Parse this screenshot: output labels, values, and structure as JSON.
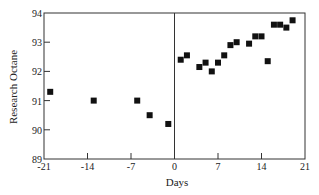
{
  "chart_data": {
    "type": "scatter",
    "title": "",
    "xlabel": "Days",
    "ylabel": "Research Octane",
    "xlim": [
      -21,
      21
    ],
    "ylim": [
      89,
      94
    ],
    "x_ticks": [
      -21,
      -14,
      -7,
      0,
      7,
      14,
      21
    ],
    "y_ticks": [
      89,
      90,
      91,
      92,
      93,
      94
    ],
    "grid": false,
    "legend": null,
    "reference_line": {
      "axis": "x",
      "value": 0
    },
    "marker": "square",
    "marker_color": "#111111",
    "series": [
      {
        "name": "Research Octane",
        "points": [
          {
            "x": -20,
            "y": 91.3
          },
          {
            "x": -13,
            "y": 91.0
          },
          {
            "x": -6,
            "y": 91.0
          },
          {
            "x": -4,
            "y": 90.5
          },
          {
            "x": -1,
            "y": 90.2
          },
          {
            "x": 1,
            "y": 92.4
          },
          {
            "x": 2,
            "y": 92.55
          },
          {
            "x": 4,
            "y": 92.15
          },
          {
            "x": 5,
            "y": 92.3
          },
          {
            "x": 6,
            "y": 92.0
          },
          {
            "x": 7,
            "y": 92.3
          },
          {
            "x": 8,
            "y": 92.55
          },
          {
            "x": 9,
            "y": 92.9
          },
          {
            "x": 10,
            "y": 93.0
          },
          {
            "x": 12,
            "y": 92.95
          },
          {
            "x": 13,
            "y": 93.2
          },
          {
            "x": 14,
            "y": 93.2
          },
          {
            "x": 15,
            "y": 92.35
          },
          {
            "x": 16,
            "y": 93.6
          },
          {
            "x": 17,
            "y": 93.6
          },
          {
            "x": 18,
            "y": 93.5
          },
          {
            "x": 19,
            "y": 93.75
          }
        ]
      }
    ]
  },
  "labels": {
    "xlabel": "Days",
    "ylabel": "Research Octane"
  }
}
